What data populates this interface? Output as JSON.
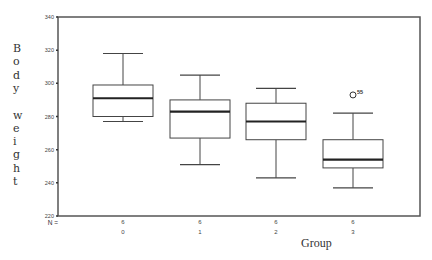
{
  "chart_data": {
    "type": "boxplot",
    "title": "",
    "xlabel": "Group",
    "ylabel": "Body weight",
    "ylim": [
      220,
      340
    ],
    "yticks": [
      220,
      240,
      260,
      280,
      300,
      320,
      340
    ],
    "ytick_labels": [
      "220",
      "240",
      "260",
      "280",
      "300",
      "320",
      "340"
    ],
    "categories": [
      "0",
      "1",
      "2",
      "3"
    ],
    "n_label": "N =",
    "n_values": [
      "6",
      "6",
      "6",
      "6"
    ],
    "grid": false,
    "legend": null,
    "boxes": [
      {
        "group": "0",
        "whisker_low": 277,
        "q1": 280,
        "median": 291,
        "q3": 299,
        "whisker_high": 318,
        "outliers": []
      },
      {
        "group": "1",
        "whisker_low": 251,
        "q1": 267,
        "median": 283,
        "q3": 290,
        "whisker_high": 305,
        "outliers": []
      },
      {
        "group": "2",
        "whisker_low": 243,
        "q1": 266,
        "median": 277,
        "q3": 288,
        "whisker_high": 297,
        "outliers": []
      },
      {
        "group": "3",
        "whisker_low": 237,
        "q1": 249,
        "median": 254,
        "q3": 266,
        "whisker_high": 282,
        "outliers": [
          {
            "value": 293,
            "label": "55"
          }
        ]
      }
    ]
  },
  "axis": {
    "ylabel_letters": [
      "B",
      "o",
      "d",
      "y",
      "",
      "w",
      "e",
      "i",
      "g",
      "h",
      "t"
    ]
  }
}
